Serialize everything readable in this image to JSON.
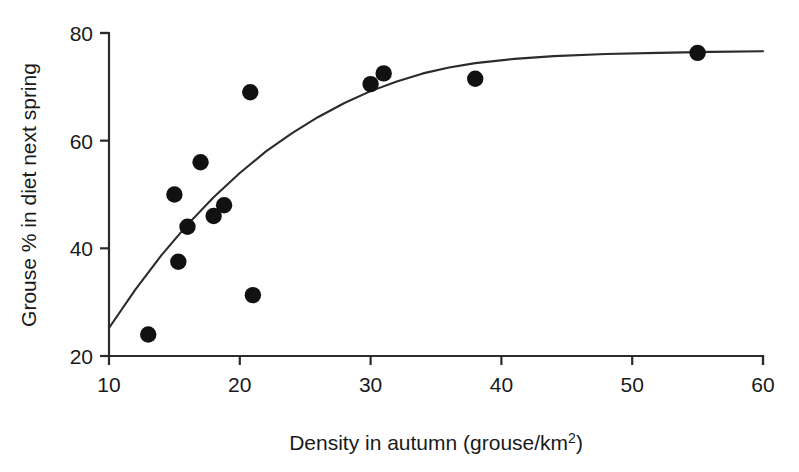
{
  "chart_data": {
    "type": "scatter",
    "title": "",
    "xlabel": "Density in autumn (grouse/km²)",
    "ylabel": "Grouse % in diet next spring",
    "xlim": [
      10,
      60
    ],
    "ylim": [
      20,
      80
    ],
    "xticks": [
      10,
      20,
      30,
      40,
      50,
      60
    ],
    "yticks": [
      20,
      40,
      60,
      80
    ],
    "xtick_labels": [
      "10",
      "20",
      "30",
      "40",
      "50",
      "60"
    ],
    "ytick_labels": [
      "20",
      "40",
      "60",
      "80"
    ],
    "grid": false,
    "legend": "none",
    "marker": "filled-circle",
    "marker_color": "#111111",
    "curve_color": "#2b2b2b",
    "axis_color": "#2b2b2b",
    "points": [
      {
        "x": 13.0,
        "y": 24.0
      },
      {
        "x": 15.0,
        "y": 50.0
      },
      {
        "x": 15.3,
        "y": 37.5
      },
      {
        "x": 16.0,
        "y": 44.0
      },
      {
        "x": 17.0,
        "y": 56.0
      },
      {
        "x": 18.0,
        "y": 46.0
      },
      {
        "x": 18.8,
        "y": 48.0
      },
      {
        "x": 20.8,
        "y": 69.0
      },
      {
        "x": 21.0,
        "y": 31.3
      },
      {
        "x": 30.0,
        "y": 70.5
      },
      {
        "x": 31.0,
        "y": 72.5
      },
      {
        "x": 38.0,
        "y": 71.5
      },
      {
        "x": 55.0,
        "y": 76.3
      }
    ],
    "fit_curve": {
      "label": "asymptotic fit",
      "points": [
        {
          "x": 10.0,
          "y": 25.2
        },
        {
          "x": 12.0,
          "y": 32.3
        },
        {
          "x": 14.0,
          "y": 38.7
        },
        {
          "x": 16.0,
          "y": 44.4
        },
        {
          "x": 18.0,
          "y": 49.5
        },
        {
          "x": 20.0,
          "y": 54.0
        },
        {
          "x": 22.0,
          "y": 58.0
        },
        {
          "x": 24.0,
          "y": 61.4
        },
        {
          "x": 26.0,
          "y": 64.4
        },
        {
          "x": 28.0,
          "y": 67.0
        },
        {
          "x": 30.0,
          "y": 69.2
        },
        {
          "x": 32.0,
          "y": 71.0
        },
        {
          "x": 34.0,
          "y": 72.5
        },
        {
          "x": 36.0,
          "y": 73.6
        },
        {
          "x": 38.0,
          "y": 74.4
        },
        {
          "x": 41.0,
          "y": 75.2
        },
        {
          "x": 44.0,
          "y": 75.7
        },
        {
          "x": 48.0,
          "y": 76.1
        },
        {
          "x": 52.0,
          "y": 76.3
        },
        {
          "x": 56.0,
          "y": 76.5
        },
        {
          "x": 60.0,
          "y": 76.6
        }
      ]
    }
  },
  "axes": {
    "x_title_main": "Density in autumn (grouse/km",
    "x_title_sup": "2",
    "x_title_tail": ")",
    "y_title": "Grouse % in diet next spring"
  }
}
